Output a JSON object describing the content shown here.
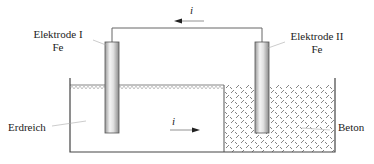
{
  "diagram": {
    "electrode_left": {
      "name": "Elektrode I",
      "material": "Fe"
    },
    "electrode_right": {
      "name": "Elektrode II",
      "material": "Fe"
    },
    "medium_left": "Erdreich",
    "medium_right": "Beton",
    "current_symbol_top": "i",
    "current_symbol_bottom": "i",
    "colors": {
      "line": "#555555",
      "hatch": "#777777",
      "electrode_light": "#f2f2f2",
      "electrode_dark": "#8c8c8c"
    }
  }
}
